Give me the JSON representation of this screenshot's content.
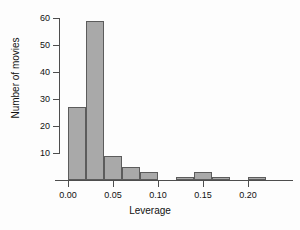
{
  "chart_data": {
    "type": "bar",
    "title": "",
    "subtitle": "",
    "xlabel": "Leverage",
    "ylabel": "Number of movies",
    "xlim": [
      -0.005,
      0.225
    ],
    "ylim": [
      0,
      62
    ],
    "grid": false,
    "legend": null,
    "bin_width": 0.02,
    "x_ticks": [
      0.0,
      0.05,
      0.1,
      0.15,
      0.2
    ],
    "x_tick_labels": [
      "0.00",
      "0.05",
      "0.10",
      "0.15",
      "0.20"
    ],
    "y_ticks": [
      10,
      20,
      30,
      40,
      50,
      60
    ],
    "y_tick_labels": [
      "10",
      "20",
      "30",
      "40",
      "50",
      "60"
    ],
    "bin_edges": [
      0.0,
      0.02,
      0.04,
      0.06,
      0.08,
      0.1,
      0.12,
      0.14,
      0.16,
      0.18,
      0.2,
      0.22
    ],
    "categories": [
      "0.00-0.02",
      "0.02-0.04",
      "0.04-0.06",
      "0.06-0.08",
      "0.08-0.10",
      "0.10-0.12",
      "0.12-0.14",
      "0.14-0.16",
      "0.16-0.18",
      "0.18-0.20",
      "0.20-0.22"
    ],
    "values": [
      27,
      59,
      9,
      5,
      3,
      0,
      1,
      3,
      1,
      0,
      1
    ],
    "bars": [
      {
        "label": "0.00-0.02",
        "x0": 0.0,
        "x1": 0.02,
        "value": 27
      },
      {
        "label": "0.02-0.04",
        "x0": 0.02,
        "x1": 0.04,
        "value": 59
      },
      {
        "label": "0.04-0.06",
        "x0": 0.04,
        "x1": 0.06,
        "value": 9
      },
      {
        "label": "0.06-0.08",
        "x0": 0.06,
        "x1": 0.08,
        "value": 5
      },
      {
        "label": "0.08-0.10",
        "x0": 0.08,
        "x1": 0.1,
        "value": 3
      },
      {
        "label": "0.10-0.12",
        "x0": 0.1,
        "x1": 0.12,
        "value": 0
      },
      {
        "label": "0.12-0.14",
        "x0": 0.12,
        "x1": 0.14,
        "value": 1
      },
      {
        "label": "0.14-0.16",
        "x0": 0.14,
        "x1": 0.16,
        "value": 3
      },
      {
        "label": "0.16-0.18",
        "x0": 0.16,
        "x1": 0.18,
        "value": 1
      },
      {
        "label": "0.18-0.20",
        "x0": 0.18,
        "x1": 0.2,
        "value": 0
      },
      {
        "label": "0.20-0.22",
        "x0": 0.2,
        "x1": 0.22,
        "value": 1
      }
    ],
    "colors": {
      "bar_fill": "#a9a9a9",
      "bar_border": "#5c5c5c",
      "axis": "#4d4d4d",
      "text": "#111111",
      "background": "#fdfdfd"
    }
  }
}
